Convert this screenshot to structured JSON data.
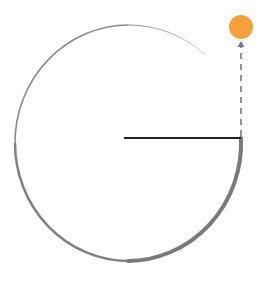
{
  "diagram": {
    "colors": {
      "arc": "#7a7a7a",
      "radius_line": "#222222",
      "dashed_arrow": "#77777f",
      "dot": "#f5a03a",
      "background": "#ffffff"
    },
    "circle": {
      "cx": 128,
      "cy": 140,
      "r": 114
    },
    "radius_line": {
      "x1": 124,
      "y1": 138,
      "x2": 241,
      "y2": 138
    },
    "dashed_arrow": {
      "x": 241,
      "y_start": 136,
      "y_end": 44
    },
    "dot": {
      "cx": 241,
      "cy": 27,
      "r": 12
    }
  }
}
